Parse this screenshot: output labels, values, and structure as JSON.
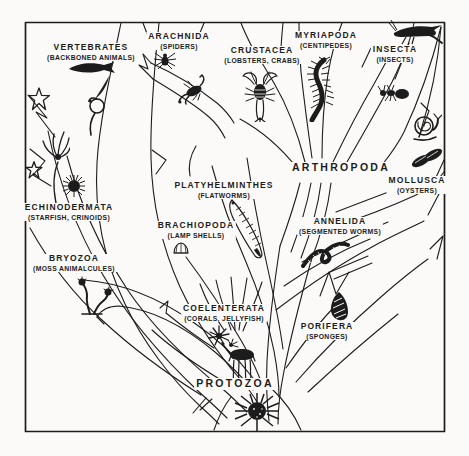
{
  "figure": {
    "root_label": "PROTOZOA"
  },
  "colors": {
    "ink": "#1c1c1c",
    "paper": "#fbfaf8"
  },
  "taxa": [
    {
      "id": "vertebrates",
      "name": "VERTEBRATES",
      "common": "(BACKBONED ANIMALS)"
    },
    {
      "id": "arachnida",
      "name": "ARACHNIDA",
      "common": "(SPIDERS)"
    },
    {
      "id": "crustacea",
      "name": "CRUSTACEA",
      "common": "(LOBSTERS, CRABS)"
    },
    {
      "id": "myriapoda",
      "name": "MYRIAPODA",
      "common": "(CENTIPEDES)"
    },
    {
      "id": "insecta",
      "name": "INSECTA",
      "common": "(INSECTS)"
    },
    {
      "id": "arthropoda",
      "name": "ARTHROPODA",
      "common": ""
    },
    {
      "id": "mollusca",
      "name": "MOLLUSCA",
      "common": "(OYSTERS)"
    },
    {
      "id": "platyhelminthes",
      "name": "PLATYHELMINTHES",
      "common": "(FLATWORMS)"
    },
    {
      "id": "annelida",
      "name": "ANNELIDA",
      "common": "(SEGMENTED WORMS)"
    },
    {
      "id": "echinodermata",
      "name": "ECHINODERMATA",
      "common": "(STARFISH, CRINOIDS)"
    },
    {
      "id": "brachiopoda",
      "name": "BRACHIOPODA",
      "common": "(LAMP SHELLS)"
    },
    {
      "id": "bryozoa",
      "name": "BRYOZOA",
      "common": "(MOSS ANIMALCULES)"
    },
    {
      "id": "coelenterata",
      "name": "COELENTERATA",
      "common": "(CORALS, JELLYFISH)"
    },
    {
      "id": "porifera",
      "name": "PORIFERA",
      "common": "(SPONGES)"
    },
    {
      "id": "protozoa",
      "name": "PROTOZOA",
      "common": ""
    }
  ],
  "icons": [
    {
      "name": "fish-icon",
      "depicts": "fish silhouette"
    },
    {
      "name": "lancelet-icon",
      "depicts": "lancelet"
    },
    {
      "name": "lamprey-icon",
      "depicts": "coiled lamprey"
    },
    {
      "name": "starfish-icon",
      "depicts": "starfish"
    },
    {
      "name": "small-starfish-icon",
      "depicts": "small starfish"
    },
    {
      "name": "crinoid-icon",
      "depicts": "crinoid sea lily"
    },
    {
      "name": "sea-urchin-icon",
      "depicts": "sea urchin"
    },
    {
      "name": "spider-icon",
      "depicts": "spider"
    },
    {
      "name": "scorpion-icon",
      "depicts": "scorpion"
    },
    {
      "name": "crayfish-icon",
      "depicts": "lobster / crayfish"
    },
    {
      "name": "centipede-icon",
      "depicts": "centipede"
    },
    {
      "name": "grasshopper-icon",
      "depicts": "grasshopper"
    },
    {
      "name": "ant-icon",
      "depicts": "ant"
    },
    {
      "name": "snail-icon",
      "depicts": "snail"
    },
    {
      "name": "oyster-icon",
      "depicts": "oyster shells"
    },
    {
      "name": "flatworm-icon",
      "depicts": "flatworm"
    },
    {
      "name": "lamp-shell-icon",
      "depicts": "lamp shell"
    },
    {
      "name": "bryozoan-icon",
      "depicts": "bryozoan colony"
    },
    {
      "name": "segmented-worm-icon",
      "depicts": "segmented worm"
    },
    {
      "name": "coral-polyp-icon",
      "depicts": "coral polyps"
    },
    {
      "name": "jellyfish-icon",
      "depicts": "jellyfish"
    },
    {
      "name": "sponge-icon",
      "depicts": "sponge"
    },
    {
      "name": "radiolarian-icon",
      "depicts": "protozoan (radiolarian)"
    }
  ]
}
